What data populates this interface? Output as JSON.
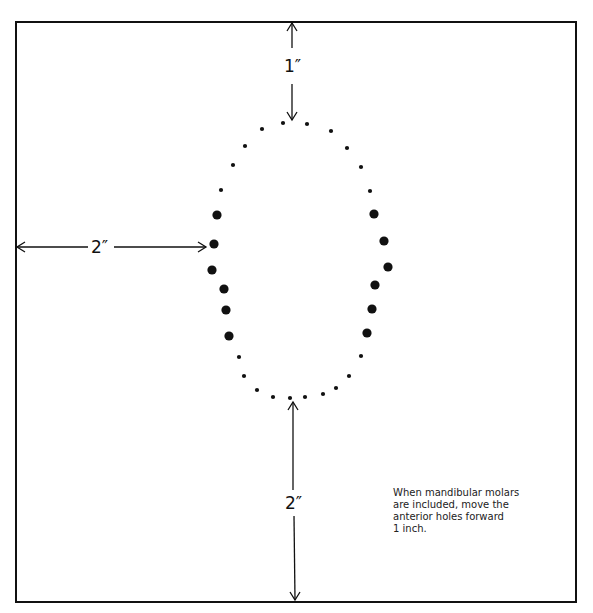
{
  "diagram": {
    "type": "template-layout",
    "border": {
      "x": 16,
      "y": 22,
      "width": 560,
      "height": 580,
      "stroke": "#111111"
    },
    "dimensions": {
      "top": {
        "label": "1″",
        "description": "Distance from top edge to anterior of arch"
      },
      "left": {
        "label": "2″",
        "description": "Distance from left edge to widest point of arch"
      },
      "bottom": {
        "label": "2″",
        "description": "Distance from posterior of arch to bottom edge"
      }
    },
    "note": {
      "lines": [
        "When mandibular molars",
        "are included, move the",
        "anterior holes forward",
        "1 inch."
      ]
    },
    "holes": [
      {
        "x": 262,
        "y": 129,
        "size": "small"
      },
      {
        "x": 283,
        "y": 123,
        "size": "small"
      },
      {
        "x": 307,
        "y": 124,
        "size": "small"
      },
      {
        "x": 331,
        "y": 131,
        "size": "small"
      },
      {
        "x": 347,
        "y": 148,
        "size": "small"
      },
      {
        "x": 361,
        "y": 167,
        "size": "small"
      },
      {
        "x": 370,
        "y": 191,
        "size": "small"
      },
      {
        "x": 374,
        "y": 214,
        "size": "large"
      },
      {
        "x": 384,
        "y": 241,
        "size": "large"
      },
      {
        "x": 388,
        "y": 267,
        "size": "large"
      },
      {
        "x": 375,
        "y": 285,
        "size": "large"
      },
      {
        "x": 372,
        "y": 309,
        "size": "large"
      },
      {
        "x": 367,
        "y": 333,
        "size": "large"
      },
      {
        "x": 361,
        "y": 356,
        "size": "small"
      },
      {
        "x": 349,
        "y": 376,
        "size": "small"
      },
      {
        "x": 336,
        "y": 388,
        "size": "small"
      },
      {
        "x": 323,
        "y": 394,
        "size": "small"
      },
      {
        "x": 305,
        "y": 397,
        "size": "small"
      },
      {
        "x": 290,
        "y": 398,
        "size": "small"
      },
      {
        "x": 273,
        "y": 397,
        "size": "small"
      },
      {
        "x": 257,
        "y": 390,
        "size": "small"
      },
      {
        "x": 244,
        "y": 376,
        "size": "small"
      },
      {
        "x": 239,
        "y": 357,
        "size": "small"
      },
      {
        "x": 229,
        "y": 336,
        "size": "large"
      },
      {
        "x": 226,
        "y": 310,
        "size": "large"
      },
      {
        "x": 224,
        "y": 289,
        "size": "large"
      },
      {
        "x": 212,
        "y": 270,
        "size": "large"
      },
      {
        "x": 214,
        "y": 244,
        "size": "large"
      },
      {
        "x": 217,
        "y": 215,
        "size": "large"
      },
      {
        "x": 221,
        "y": 190,
        "size": "small"
      },
      {
        "x": 233,
        "y": 165,
        "size": "small"
      },
      {
        "x": 245,
        "y": 146,
        "size": "small"
      }
    ],
    "colors": {
      "ink": "#111111",
      "background": "#ffffff"
    }
  }
}
